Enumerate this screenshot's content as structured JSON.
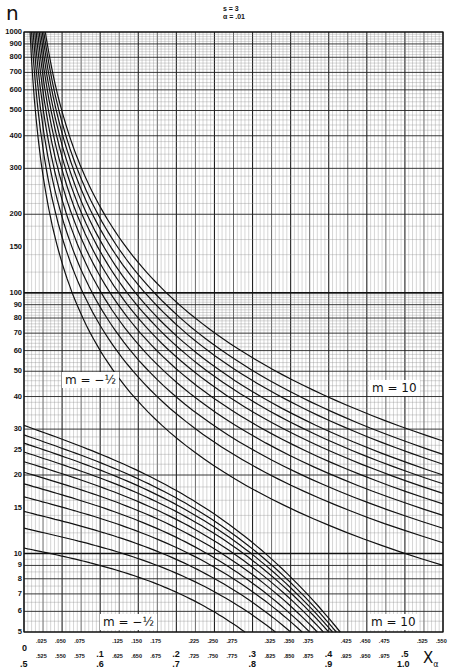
{
  "chart_data": {
    "type": "line",
    "title": "",
    "params": {
      "s": "s = 3",
      "alpha": "α = .01"
    },
    "ylabel": "n",
    "xlabel": "X_α",
    "yscale": "log",
    "ylim": [
      5,
      1000
    ],
    "grid": true,
    "yticks": [
      5,
      6,
      7,
      8,
      9,
      10,
      15,
      20,
      25,
      30,
      40,
      50,
      60,
      70,
      80,
      90,
      100,
      150,
      200,
      300,
      400,
      500,
      600,
      700,
      800,
      900,
      1000
    ],
    "xaxis": {
      "upper_range": [
        0,
        0.55
      ],
      "lower_range": [
        0.5,
        1.05
      ],
      "upper_major": [
        ".1",
        ".2",
        ".3",
        ".4",
        ".5"
      ],
      "upper_minor": [
        ".025",
        ".050",
        ".075",
        ".125",
        ".150",
        ".175",
        ".225",
        ".250",
        ".275",
        ".325",
        ".350",
        ".375",
        ".425",
        ".450",
        ".475",
        ".525",
        ".550"
      ],
      "lower_major": [
        ".5",
        ".6",
        ".7",
        ".8",
        ".9",
        "1.0"
      ],
      "lower_minor": [
        ".525",
        ".550",
        ".575",
        ".625",
        ".650",
        ".675",
        ".725",
        ".750",
        ".775",
        ".825",
        ".850",
        ".875",
        ".925",
        ".950",
        ".975"
      ],
      "upper_origin": "0",
      "lower_origin": ".5"
    },
    "families": [
      {
        "name": "upper family (x scale 0–.55)",
        "m_range_label_left": "m = -1/2",
        "m_range_label_right": "m = 10",
        "curve_count": 11,
        "note": "Curves start near n=1000 at x≈0.01–0.03 and descend to n≈9–27 at x=0.55",
        "series_endpoints": {
          "x_start_at_n1000": [
            0.008,
            0.01,
            0.012,
            0.014,
            0.016,
            0.018,
            0.02,
            0.022,
            0.024,
            0.026,
            0.028
          ],
          "n_at_x_0_55": [
            9,
            11,
            12.5,
            14,
            15.5,
            17,
            18.5,
            20,
            22,
            24,
            27
          ]
        }
      },
      {
        "name": "lower family (x scale .5–1.05)",
        "m_range_label_left": "m = -1/2",
        "m_range_label_right": "m = 10",
        "curve_count": 11,
        "note": "Curves start at x=.5 with n≈10–31 and fall to n=5 near x≈.79–.92",
        "series_endpoints": {
          "n_at_x_0_5": [
            10.5,
            12.5,
            14.5,
            16.5,
            18.5,
            20.5,
            22.5,
            24.5,
            26.5,
            28.5,
            31
          ],
          "x_at_n5": [
            0.79,
            0.83,
            0.85,
            0.865,
            0.875,
            0.885,
            0.893,
            0.9,
            0.905,
            0.91,
            0.915
          ]
        }
      }
    ],
    "annotations": [
      "m = -1/2",
      "m = 10",
      "m = -1/2",
      "m = 10"
    ]
  },
  "labels": {
    "n": "n",
    "s": "s = 3",
    "alpha": "α = .01",
    "m_upper_left": "m = −½",
    "m_upper_right": "m = 10",
    "m_lower_left": "m = −½",
    "m_lower_right": "m = 10",
    "x_alpha": "X",
    "x_alpha_sub": "α"
  }
}
